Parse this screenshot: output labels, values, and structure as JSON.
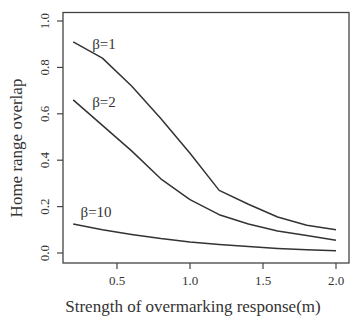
{
  "chart_data": {
    "type": "line",
    "title": "",
    "xlabel": "Strength of overmarking response(m)",
    "ylabel": "Home range overlap",
    "xlim": [
      0.13,
      2.08
    ],
    "ylim": [
      -0.04,
      1.04
    ],
    "xticks": [
      0.5,
      1.0,
      1.5,
      2.0
    ],
    "xtick_labels": [
      "0.5",
      "1.0",
      "1.5",
      "2.0"
    ],
    "yticks": [
      0.0,
      0.2,
      0.4,
      0.6,
      0.8,
      1.0
    ],
    "ytick_labels": [
      "0.0",
      "0.2",
      "0.4",
      "0.6",
      "0.8",
      "1.0"
    ],
    "grid": false,
    "legend": "inline labels",
    "x": [
      0.2,
      0.4,
      0.6,
      0.8,
      1.0,
      1.2,
      1.4,
      1.6,
      1.8,
      2.0
    ],
    "series": [
      {
        "name": "β=1",
        "values": [
          0.91,
          0.84,
          0.72,
          0.58,
          0.43,
          0.27,
          0.21,
          0.155,
          0.12,
          0.1
        ],
        "label_pos": [
          0.33,
          0.88
        ]
      },
      {
        "name": "β=2",
        "values": [
          0.66,
          0.55,
          0.44,
          0.32,
          0.23,
          0.165,
          0.125,
          0.095,
          0.075,
          0.055
        ],
        "label_pos": [
          0.33,
          0.63
        ]
      },
      {
        "name": "β=10",
        "values": [
          0.125,
          0.1,
          0.08,
          0.062,
          0.048,
          0.037,
          0.028,
          0.02,
          0.014,
          0.01
        ],
        "label_pos": [
          0.25,
          0.155
        ]
      }
    ],
    "colors": {
      "line": "#333333",
      "axis": "#444444"
    }
  }
}
